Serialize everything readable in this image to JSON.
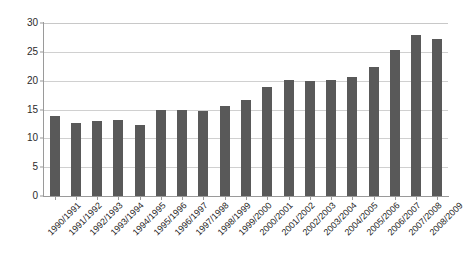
{
  "chart_data": {
    "type": "bar",
    "title": "",
    "subtitle": "",
    "xlabel": "",
    "ylabel": "",
    "ylim": [
      0,
      30
    ],
    "yticks": [
      0,
      5,
      10,
      15,
      20,
      25,
      30
    ],
    "grid": true,
    "legend": false,
    "legend_position": "none",
    "bar_color": "#595959",
    "gridline_color": "#d0d0d0",
    "axis_color": "#9a9a9a",
    "categories": [
      "1990/1991",
      "1991/1992",
      "1992/1993",
      "1993/1994",
      "1994/1995",
      "1995/1996",
      "1996/1997",
      "1997/1998",
      "1998/1999",
      "1999/2000",
      "2000/2001",
      "2001/2002",
      "2002/2003",
      "2003/2004",
      "2004/2005",
      "2005/2006",
      "2006/2007",
      "2007/2008",
      "2008/2009"
    ],
    "values": [
      13.8,
      12.6,
      13.0,
      13.1,
      12.4,
      15.0,
      14.9,
      14.8,
      15.6,
      16.7,
      18.9,
      20.1,
      19.9,
      20.2,
      20.7,
      22.4,
      25.3,
      27.9,
      27.3
    ]
  }
}
